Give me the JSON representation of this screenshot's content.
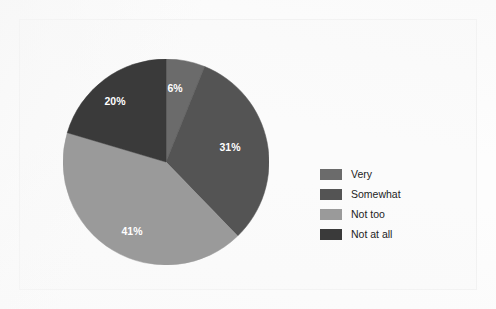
{
  "chart_data": {
    "type": "pie",
    "title": "",
    "subtitle": "",
    "xlabel": "",
    "ylabel": "",
    "legend_position": "right",
    "grid": false,
    "start_angle_deg": 0,
    "direction": "clockwise",
    "categories": [
      "Very",
      "Somewhat",
      "Not too",
      "Not at all"
    ],
    "values": [
      6,
      31,
      41,
      20
    ],
    "value_unit": "%",
    "data_labels": [
      "6%",
      "31%",
      "41%",
      "20%"
    ],
    "colors": [
      "#6b6b6b",
      "#545454",
      "#9a9a9a",
      "#3a3a3a"
    ],
    "slices": [
      {
        "label": "Very",
        "value": 6,
        "display": "6%",
        "color": "#6b6b6b",
        "label_x": 112,
        "label_y": 30
      },
      {
        "label": "Somewhat",
        "value": 31,
        "display": "31%",
        "color": "#545454",
        "label_x": 167,
        "label_y": 89
      },
      {
        "label": "Not too",
        "value": 41,
        "display": "41%",
        "color": "#9a9a9a",
        "label_x": 69,
        "label_y": 173
      },
      {
        "label": "Not at all",
        "value": 20,
        "display": "20%",
        "color": "#3a3a3a",
        "label_x": 52,
        "label_y": 43
      }
    ]
  },
  "legend": {
    "items": [
      {
        "label": "Very",
        "color": "#6b6b6b"
      },
      {
        "label": "Somewhat",
        "color": "#545454"
      },
      {
        "label": "Not too",
        "color": "#9a9a9a"
      },
      {
        "label": "Not at all",
        "color": "#3a3a3a"
      }
    ]
  },
  "colors": {
    "background": "#fdfdfd",
    "frame_border": "#f0f0f0",
    "label_text": "#ffffff",
    "legend_text": "#232323"
  }
}
